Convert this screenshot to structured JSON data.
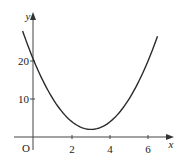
{
  "chart_data": {
    "type": "line",
    "title": "",
    "xlabel": "x",
    "ylabel": "y",
    "origin_label": "O",
    "x_ticks": [
      2,
      4,
      6
    ],
    "x_tick_labels": [
      "2",
      "4",
      "6"
    ],
    "y_ticks": [
      10,
      20
    ],
    "y_tick_labels": [
      "10",
      "20"
    ],
    "xlim": [
      -0.6,
      7.3
    ],
    "ylim": [
      0,
      30
    ],
    "grid": false,
    "legend": null,
    "series": [
      {
        "name": "curve",
        "description": "U-shaped parabola, y-intercept 20, minimum near (3, 2)",
        "x": [
          -0.6,
          0,
          0.5,
          1,
          1.5,
          2,
          2.5,
          3,
          3.5,
          4,
          4.5,
          5,
          5.5,
          6,
          6.5
        ],
        "y": [
          27.9,
          20,
          14.5,
          10,
          6.5,
          4,
          2.5,
          2,
          2.5,
          4,
          6.5,
          10,
          14.5,
          20,
          26.5
        ]
      }
    ]
  },
  "axes": {
    "x_label": "x",
    "y_label": "y",
    "origin": "O",
    "x_ticks": [
      "2",
      "4",
      "6"
    ],
    "y_ticks": [
      "20",
      "10"
    ]
  },
  "colors": {
    "curve": "#2a2a2a",
    "axis": "#444444",
    "background": "#ffffff"
  }
}
